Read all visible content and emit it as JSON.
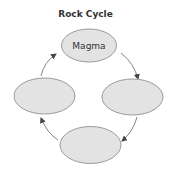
{
  "diagram": {
    "title": "Rock Cycle",
    "nodes": [
      {
        "id": "top",
        "label": "Magma"
      },
      {
        "id": "right",
        "label": ""
      },
      {
        "id": "bottom",
        "label": ""
      },
      {
        "id": "left",
        "label": ""
      }
    ],
    "edges": [
      {
        "from": "left",
        "to": "top"
      },
      {
        "from": "top",
        "to": "right"
      },
      {
        "from": "right",
        "to": "bottom"
      },
      {
        "from": "bottom",
        "to": "left"
      }
    ],
    "colors": {
      "node_fill": "#e3e3e3",
      "node_stroke": "#9a9a9a",
      "arrow": "#555555",
      "text": "#333333"
    }
  }
}
